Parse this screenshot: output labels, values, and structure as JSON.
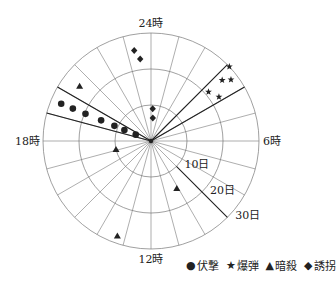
{
  "chart_data": {
    "type": "scatter",
    "subtype": "polar",
    "title": "",
    "angular_axis": {
      "unit": "hour",
      "range": [
        0,
        24
      ],
      "direction": "clockwise",
      "zero_at": "top",
      "tick_count": 24,
      "labels": [
        {
          "hour": 0,
          "text": "24時"
        },
        {
          "hour": 6,
          "text": "6時"
        },
        {
          "hour": 12,
          "text": "12時"
        },
        {
          "hour": 18,
          "text": "18時"
        }
      ]
    },
    "radial_axis": {
      "unit": "day",
      "range": [
        0,
        30
      ],
      "rings": [
        10,
        20,
        30
      ],
      "labels": [
        "10日",
        "20日",
        "30日"
      ],
      "label_angle_hour": 9
    },
    "highlight_sectors": [
      {
        "from_hour": 19,
        "to_hour": 20,
        "series": "伏撃"
      },
      {
        "from_hour": 3,
        "to_hour": 4,
        "series": "爆弾"
      }
    ],
    "series": [
      {
        "name": "伏撃",
        "marker": "circle",
        "points": [
          {
            "hour": 19.5,
            "day": 27
          },
          {
            "hour": 19.5,
            "day": 23.5
          },
          {
            "hour": 19.5,
            "day": 19.7
          },
          {
            "hour": 19.5,
            "day": 15
          },
          {
            "hour": 19.5,
            "day": 11
          },
          {
            "hour": 19.5,
            "day": 8
          },
          {
            "hour": 19.5,
            "day": 4.6
          }
        ]
      },
      {
        "name": "爆弾",
        "marker": "star",
        "points": [
          {
            "hour": 3.1,
            "day": 30
          },
          {
            "hour": 3.3,
            "day": 26
          },
          {
            "hour": 3.5,
            "day": 28
          },
          {
            "hour": 3.3,
            "day": 21
          },
          {
            "hour": 3.8,
            "day": 22.5
          }
        ]
      },
      {
        "name": "暗殺",
        "marker": "triangle",
        "points": [
          {
            "hour": 20.5,
            "day": 25
          },
          {
            "hour": 17.1,
            "day": 10
          },
          {
            "hour": 10.1,
            "day": 15
          },
          {
            "hour": 13.3,
            "day": 28
          }
        ]
      },
      {
        "name": "誘拐",
        "marker": "diamond",
        "points": [
          {
            "hour": 23.3,
            "day": 25.6
          },
          {
            "hour": 23.5,
            "day": 23
          },
          {
            "hour": 0.2,
            "day": 9
          },
          {
            "hour": 0.3,
            "day": 6.4
          }
        ]
      }
    ],
    "legend_position": "bottom-right",
    "grid": true
  },
  "legend": [
    {
      "symbol": "●",
      "label": "伏撃"
    },
    {
      "symbol": "★",
      "label": "爆弾"
    },
    {
      "symbol": "▲",
      "label": "暗殺"
    },
    {
      "symbol": "◆",
      "label": "誘拐"
    }
  ],
  "colors": {
    "ink": "#222222",
    "grid": "#777777",
    "background": "#ffffff"
  }
}
